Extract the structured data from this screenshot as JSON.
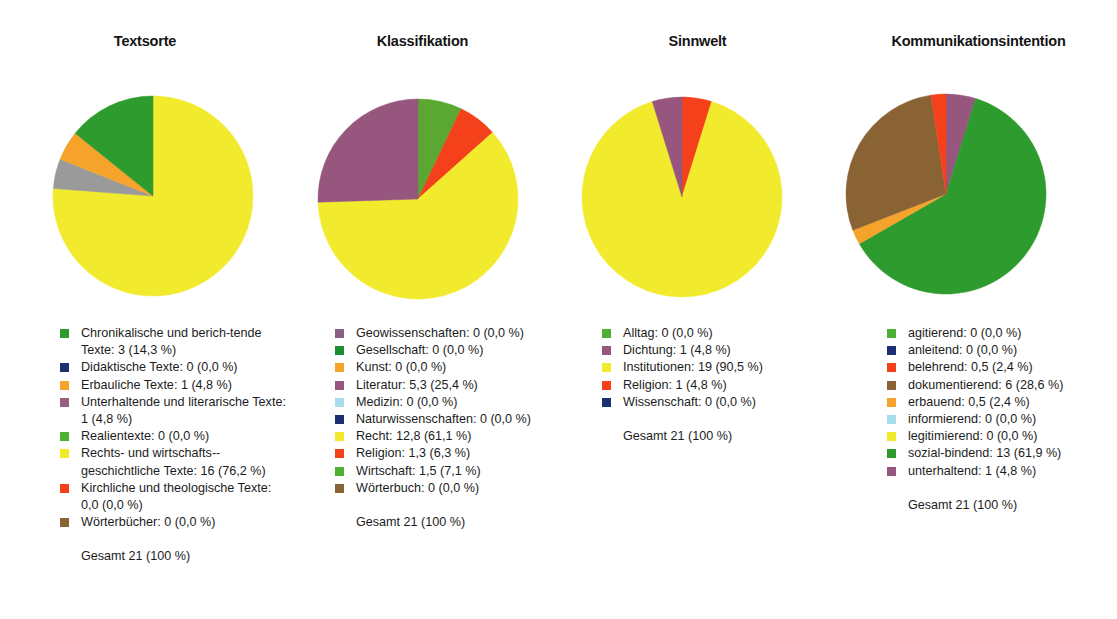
{
  "figure": {
    "background": "#ffffff",
    "total_label_default": "Gesamt 21 (100 %)"
  },
  "chart_data": [
    {
      "type": "pie",
      "title": "Textsorte",
      "total_label": "Gesamt 21 (100 %)",
      "start_angle": 0,
      "direction": "counterclockwise",
      "categories": [
        "Chronikalische und berichtende Texte",
        "Didaktische Texte",
        "Erbauliche Texte",
        "Unterhaltende und literarische Texte",
        "Realientexte",
        "Rechts- und wirtschaftsgeschichtliche Texte",
        "Kirchliche und theologische Texte",
        "Wörterbücher"
      ],
      "values": [
        3,
        0,
        1,
        1,
        0,
        16,
        0,
        0
      ],
      "percents": [
        14.3,
        0.0,
        4.8,
        4.8,
        0.0,
        76.2,
        0.0,
        0.0
      ],
      "colors": [
        "#2e9b2e",
        "#1b2f73",
        "#f6a32c",
        "#9a9a9a",
        "#4eb033",
        "#f2ea2c",
        "#f4411b",
        "#8a6334"
      ],
      "legend_entries": [
        {
          "label": "Chronikalische und berich-­tende Texte: 3 (14,3 %)",
          "color": "#2e9b2e"
        },
        {
          "label": "Didaktische Texte: 0 (0,0 %)",
          "color": "#1b2f73"
        },
        {
          "label": "Erbauliche Texte: 1 (4,8 %)",
          "color": "#f6a32c"
        },
        {
          "label": "Unterhaltende und literarische Texte: 1 (4,8 %)",
          "color": "#975f83"
        },
        {
          "label": "Realientexte: 0 (0,0 %)",
          "color": "#4eb033"
        },
        {
          "label": "Rechts- und wirtschafts-­geschichtliche Texte: 16 (76,2 %)",
          "color": "#f2ea2c"
        },
        {
          "label": "Kirchliche und theologische Texte: 0,0 (0,0 %)",
          "color": "#f4411b"
        },
        {
          "label": "Wörterbücher: 0 (0,0 %)",
          "color": "#8a6334"
        }
      ],
      "slices": [
        {
          "name": "Rechts- und wirtschaftsgeschichtliche Texte",
          "percent": 76.2,
          "color": "#f2ea2c"
        },
        {
          "name": "Unterhaltende und literarische Texte",
          "percent": 4.8,
          "color": "#9a9a9a"
        },
        {
          "name": "Erbauliche Texte",
          "percent": 4.8,
          "color": "#f6a32c"
        },
        {
          "name": "Chronikalische und berichtende Texte",
          "percent": 14.2,
          "color": "#2e9b2e"
        }
      ]
    },
    {
      "type": "pie",
      "title": "Klassifikation",
      "total_label": "Gesamt 21 (100 %)",
      "start_angle": 0,
      "direction": "counterclockwise",
      "categories": [
        "Geowissenschaften",
        "Gesellschaft",
        "Kunst",
        "Literatur",
        "Medizin",
        "Naturwissenschaften",
        "Recht",
        "Religion",
        "Wirtschaft",
        "Wörterbuch"
      ],
      "values": [
        0,
        0,
        0,
        5.3,
        0,
        0,
        12.8,
        1.3,
        1.5,
        0
      ],
      "percents": [
        0.0,
        0.0,
        0.0,
        25.4,
        0.0,
        0.0,
        61.1,
        6.3,
        7.1,
        0.0
      ],
      "legend_entries": [
        {
          "label": "Geowissenschaften: 0 (0,0 %)",
          "color": "#8a5f86"
        },
        {
          "label": "Gesellschaft: 0 (0,0 %)",
          "color": "#1e8c33"
        },
        {
          "label": "Kunst: 0 (0,0 %)",
          "color": "#f6a32c"
        },
        {
          "label": "Literatur: 5,3 (25,4 %)",
          "color": "#97567e"
        },
        {
          "label": "Medizin: 0 (0,0 %)",
          "color": "#a9dcec"
        },
        {
          "label": "Naturwissenschaften: 0 (0,0 %)",
          "color": "#1b2f73"
        },
        {
          "label": "Recht: 12,8 (61,1 %)",
          "color": "#f2ea2c"
        },
        {
          "label": "Religion: 1,3 (6,3 %)",
          "color": "#f4411b"
        },
        {
          "label": "Wirtschaft: 1,5 (7,1 %)",
          "color": "#4eb033"
        },
        {
          "label": "Wörterbuch: 0 (0,0 %)",
          "color": "#8a6334"
        }
      ],
      "slices": [
        {
          "name": "Wirtschaft",
          "percent": 7.1,
          "color": "#5aa832"
        },
        {
          "name": "Religion",
          "percent": 6.3,
          "color": "#f4411b"
        },
        {
          "name": "Recht",
          "percent": 61.1,
          "color": "#f2ea2c"
        },
        {
          "name": "Literatur",
          "percent": 25.5,
          "color": "#97567e"
        }
      ],
      "slices_clockwise": true
    },
    {
      "type": "pie",
      "title": "Sinnwelt",
      "total_label": "Gesamt 21 (100 %)",
      "start_angle": 0,
      "direction": "clockwise",
      "categories": [
        "Alltag",
        "Dichtung",
        "Institutionen",
        "Religion",
        "Wissenschaft"
      ],
      "values": [
        0,
        1,
        19,
        1,
        0
      ],
      "percents": [
        0.0,
        4.8,
        90.5,
        4.8,
        0.0
      ],
      "legend_entries": [
        {
          "label": "Alltag: 0 (0,0 %)",
          "color": "#4eb033"
        },
        {
          "label": "Dichtung: 1 (4,8 %)",
          "color": "#97567e"
        },
        {
          "label": "Institutionen: 19 (90,5 %)",
          "color": "#f2ea2c"
        },
        {
          "label": "Religion: 1 (4,8 %)",
          "color": "#f4411b"
        },
        {
          "label": "Wissenschaft: 0 (0,0 %)",
          "color": "#1b2f73"
        }
      ],
      "slices": [
        {
          "name": "Religion",
          "percent": 4.8,
          "color": "#f4411b"
        },
        {
          "name": "Institutionen",
          "percent": 90.4,
          "color": "#f2ea2c"
        },
        {
          "name": "Dichtung",
          "percent": 4.8,
          "color": "#97567e"
        }
      ],
      "slices_clockwise": true
    },
    {
      "type": "pie",
      "title": "Kommunikationsintention",
      "total_label": "Gesamt 21 (100 %)",
      "start_angle": 0,
      "direction": "clockwise",
      "categories": [
        "agitierend",
        "anleitend",
        "belehrend",
        "dokumentierend",
        "erbauend",
        "informierend",
        "legitimierend",
        "sozial-bindend",
        "unterhaltend"
      ],
      "values": [
        0,
        0,
        0.5,
        6,
        0.5,
        0,
        0,
        13,
        1
      ],
      "percents": [
        0.0,
        0.0,
        2.4,
        28.6,
        2.4,
        0.0,
        0.0,
        61.9,
        4.8
      ],
      "legend_entries": [
        {
          "label": "agitierend: 0 (0,0 %)",
          "color": "#4eb033"
        },
        {
          "label": "anleitend: 0 (0,0 %)",
          "color": "#1b2f73"
        },
        {
          "label": "belehrend: 0,5 (2,4 %)",
          "color": "#f4411b"
        },
        {
          "label": "dokumentierend: 6 (28,6 %)",
          "color": "#8a6334"
        },
        {
          "label": "erbauend: 0,5 (2,4 %)",
          "color": "#f6a32c"
        },
        {
          "label": "informierend: 0 (0,0 %)",
          "color": "#a9dcec"
        },
        {
          "label": "legitimierend: 0 (0,0 %)",
          "color": "#f2ea2c"
        },
        {
          "label": "sozial-bindend: 13 (61,9 %)",
          "color": "#2e9b2e"
        },
        {
          "label": "unterhaltend: 1 (4,8 %)",
          "color": "#97567e"
        }
      ],
      "slices": [
        {
          "name": "unterhaltend",
          "percent": 4.8,
          "color": "#97567e"
        },
        {
          "name": "sozial-bindend",
          "percent": 61.9,
          "color": "#2e9b2e"
        },
        {
          "name": "erbauend",
          "percent": 2.4,
          "color": "#f6a32c"
        },
        {
          "name": "dokumentierend",
          "percent": 28.5,
          "color": "#8a6334"
        },
        {
          "name": "belehrend",
          "percent": 2.4,
          "color": "#f4411b"
        }
      ],
      "slices_clockwise": true
    }
  ]
}
